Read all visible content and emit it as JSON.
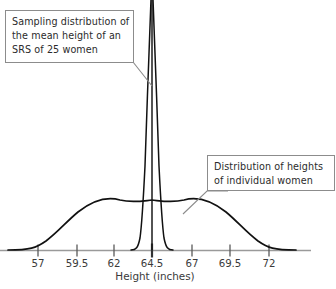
{
  "chart_data": {
    "type": "line",
    "title": "",
    "xlabel": "Height (inches)",
    "ylabel": "",
    "grid": false,
    "legend_position": "callout-boxes",
    "xlim": [
      55.5,
      74.5
    ],
    "ticks": [
      {
        "label": "57",
        "value": 57,
        "x": 38
      },
      {
        "label": "59.5",
        "value": 59.5,
        "x": 77
      },
      {
        "label": "62",
        "value": 62,
        "x": 114
      },
      {
        "label": "64.5",
        "value": 64.5,
        "x": 152
      },
      {
        "label": "67",
        "value": 67,
        "x": 192
      },
      {
        "label": "69.5",
        "value": 69.5,
        "x": 230
      },
      {
        "label": "72",
        "value": 72,
        "x": 269
      }
    ],
    "series": [
      {
        "name": "Sampling distribution of the mean height of an SRS of 25 women",
        "distribution": "normal",
        "mean": 64.5,
        "std_dev": 0.5,
        "sample_size": 25,
        "peak_clipped_at_top": true
      },
      {
        "name": "Distribution of heights of individual women",
        "distribution": "normal",
        "mean": 64.5,
        "std_dev": 2.5,
        "sample_size": 1
      }
    ],
    "annotations": [
      {
        "id": "sampling",
        "lines": [
          "Sampling distribution of",
          "the mean height of an",
          "SRS of 25 women"
        ],
        "points_to": "sampling-distribution-curve"
      },
      {
        "id": "individual",
        "lines": [
          "Distribution of heights",
          "of individual women"
        ],
        "points_to": "population-distribution-curve"
      }
    ]
  },
  "colors": {
    "curve": "#111111",
    "axis": "#8f8f8f",
    "tick_mark": "#5a5a5a",
    "callout_border": "#8c8c8c",
    "text": "#2b2b2b",
    "background": "#ffffff"
  },
  "callouts": {
    "sampling": {
      "line1": "Sampling distribution of",
      "line2": "the mean height of an",
      "line3": "SRS of 25 women"
    },
    "individual": {
      "line1": "Distribution of heights",
      "line2": "of individual women"
    }
  },
  "axis": {
    "title": "Height (inches)",
    "tick_labels": [
      "57",
      "59.5",
      "62",
      "64.5",
      "67",
      "69.5",
      "72"
    ]
  }
}
